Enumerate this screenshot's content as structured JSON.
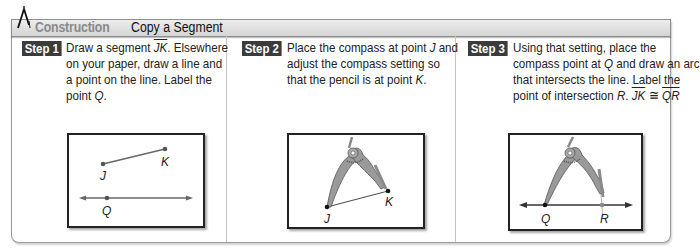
{
  "header": {
    "icon": "compass-icon",
    "category": "Construction",
    "title": "Copy a Segment"
  },
  "colors": {
    "badge_bg": "#3b3b3b",
    "header_bg": "#dcdcdc",
    "category_text": "#8a8a8a",
    "compass_fill": "#9a9a9a"
  },
  "steps": [
    {
      "badge": "Step 1",
      "lines": [
        "Draw a segment",
        "JK",
        ". Elsewhere",
        "on your paper, draw a line and",
        "a point on the line. Label the",
        "point ",
        "Q",
        "."
      ],
      "diagram": {
        "labels": {
          "J": "J",
          "K": "K",
          "Q": "Q"
        }
      }
    },
    {
      "badge": "Step 2",
      "lines": [
        "Place the compass at point ",
        "J",
        " and",
        "adjust the compass setting so",
        "that the pencil is at point ",
        "K",
        "."
      ],
      "diagram": {
        "labels": {
          "J": "J",
          "K": "K"
        }
      }
    },
    {
      "badge": "Step 3",
      "lines": [
        "Using that setting, place the",
        "compass point at ",
        "Q",
        " and draw an arc",
        "that intersects the line. Label the",
        "point of intersection ",
        "R",
        ". ",
        "JK",
        " ≅ ",
        "QR"
      ],
      "diagram": {
        "labels": {
          "Q": "Q",
          "R": "R"
        }
      }
    }
  ]
}
